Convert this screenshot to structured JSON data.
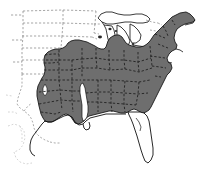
{
  "figure": {
    "kind": "distribution-range-map",
    "title": "",
    "caption": "",
    "region_described": "Eastern United States",
    "background_color": "#ffffff",
    "range_fill_color": "#6e6e6e",
    "range_outline_color": "#1a1a1a",
    "coastline_color": "#1a1a1a",
    "state_border_color": "#3a3a3a",
    "state_border_style": "dashed",
    "lake_outline_color": "#1a1a1a",
    "width_px": 202,
    "height_px": 179
  },
  "legend": {
    "present": false,
    "entries": []
  },
  "labels": {
    "present": false,
    "items": []
  },
  "map_data": {
    "type": "choropleth-range",
    "description": "Shaded gray area indicates species range across the eastern United States; unshaded white areas indicate absence.",
    "shaded_area_outline": "206,12 200,14 196,16 192,17 189,19 186,22 183,25 181,28 179,31 178,34 177,37 176,40 175,42 174,45 173,48 173,51 172,54 171,57 170,60 170,63 169,66 168,69 167,72 166,75 165,78 164,81 164,84 163,87 162,90 161,93 160,96 159,99 158,102 157,105 156,108 155,111 154,114 153,117 152,119",
    "unshaded_features": [
      "florida-peninsula",
      "great-lakes",
      "mississippi-alluvial-valley",
      "western-plains",
      "southern-louisiana-coast"
    ],
    "shaded_features": [
      "new-england",
      "mid-atlantic",
      "appalachians",
      "southeast",
      "ohio-valley",
      "lower-midwest",
      "east-texas"
    ]
  }
}
